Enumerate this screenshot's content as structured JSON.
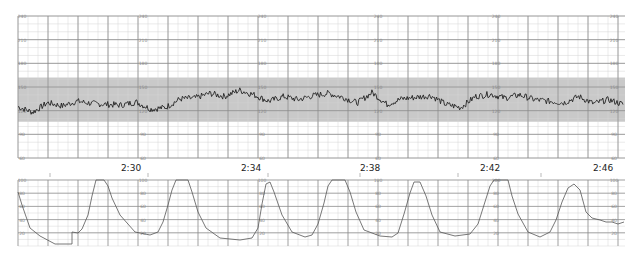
{
  "chart_data": [
    {
      "type": "line",
      "title": "Fetal Heart Rate",
      "ylabel": "bpm",
      "ylim": [
        60,
        240
      ],
      "y_ticks": [
        240,
        210,
        180,
        150,
        120,
        90,
        60
      ],
      "shaded_band": {
        "from": 110,
        "to": 160,
        "color": "#c8c8c8"
      },
      "x_ticks": [
        "2:30",
        "2:34",
        "2:38",
        "2:42",
        "2:46"
      ],
      "grid": true,
      "series": [
        {
          "name": "FHR",
          "x_minutes": [
            0,
            0.5,
            1,
            1.5,
            2,
            2.5,
            3,
            3.5,
            4,
            4.5,
            5,
            5.5,
            6,
            6.5,
            7,
            7.5,
            8,
            8.5,
            9,
            9.5,
            10,
            10.5,
            11,
            11.5,
            12,
            12.5,
            13,
            13.5,
            14,
            14.5,
            15,
            15.5,
            16,
            16.5,
            17,
            17.5,
            18,
            18.5,
            19,
            19.5,
            20,
            20.5
          ],
          "values": [
            125,
            118,
            130,
            126,
            132,
            129,
            128,
            127,
            131,
            122,
            124,
            135,
            136,
            142,
            138,
            146,
            140,
            132,
            138,
            134,
            139,
            142,
            137,
            130,
            143,
            128,
            135,
            137,
            139,
            128,
            124,
            138,
            141,
            136,
            140,
            134,
            132,
            130,
            138,
            129,
            134,
            128
          ]
        }
      ]
    },
    {
      "type": "line",
      "title": "Uterine Activity",
      "ylabel": "mmHg",
      "ylim": [
        0,
        100
      ],
      "y_ticks": [
        100,
        80,
        60,
        40,
        20
      ],
      "x_ticks": [
        "2:30",
        "2:34",
        "2:38",
        "2:42",
        "2:46"
      ],
      "grid": true,
      "series": [
        {
          "name": "UA",
          "contraction_peaks_x": [
            92,
            163,
            268,
            376,
            458,
            555,
            582
          ],
          "values_profile": "contractions approx every 2.5-3 min, peaks 90-100+ mmHg, baseline ~10-20 mmHg"
        }
      ]
    }
  ],
  "fhr_panel": {
    "scale_labels": [
      "240",
      "210",
      "180",
      "150",
      "120",
      "90",
      "60"
    ],
    "band_labels": [
      "150",
      "120"
    ]
  },
  "ua_panel": {
    "scale_labels": [
      "100",
      "80",
      "60",
      "40",
      "20"
    ]
  },
  "time_labels": [
    "2:30",
    "2:34",
    "2:38",
    "2:42",
    "2:46"
  ],
  "colors": {
    "trace": "#222222",
    "grid_major": "#8a8a8a",
    "grid_minor": "#d4d4d4",
    "band": "#c9c9c9",
    "label": "#888888"
  }
}
